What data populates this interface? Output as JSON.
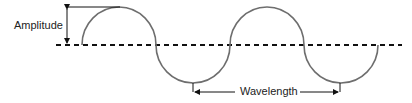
{
  "diagram": {
    "labels": {
      "amplitude": "Amplitude",
      "wavelength": "Wavelength"
    },
    "colors": {
      "wave": "#6e6e6e",
      "axis": "#111111",
      "text": "#222222"
    }
  }
}
